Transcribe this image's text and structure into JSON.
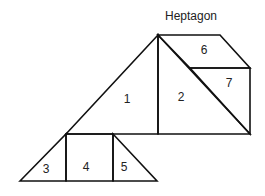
{
  "title": "Heptagon",
  "pieces": [
    {
      "id": "1",
      "label": "1",
      "shape": "triangle"
    },
    {
      "id": "2",
      "label": "2",
      "shape": "triangle"
    },
    {
      "id": "3",
      "label": "3",
      "shape": "triangle"
    },
    {
      "id": "4",
      "label": "4",
      "shape": "square"
    },
    {
      "id": "5",
      "label": "5",
      "shape": "triangle"
    },
    {
      "id": "6",
      "label": "6",
      "shape": "parallelogram"
    },
    {
      "id": "7",
      "label": "7",
      "shape": "triangle"
    }
  ],
  "colors": {
    "stroke": "#111111",
    "background": "#ffffff"
  }
}
